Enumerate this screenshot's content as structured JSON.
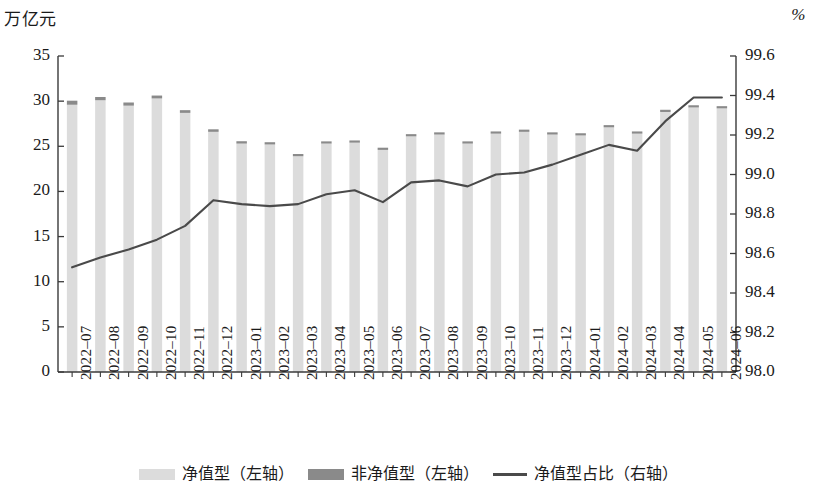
{
  "axes": {
    "left_unit": "万亿元",
    "right_unit": "%",
    "left_ticks": [
      "0",
      "5",
      "10",
      "15",
      "20",
      "25",
      "30",
      "35"
    ],
    "right_ticks": [
      "98.0",
      "98.2",
      "98.4",
      "98.6",
      "98.8",
      "99.0",
      "99.2",
      "99.4",
      "99.6"
    ]
  },
  "legend": {
    "items": [
      {
        "label": "净值型（左轴）",
        "type": "bar",
        "color": "#dcdcdc"
      },
      {
        "label": "非净值型（左轴）",
        "type": "bar",
        "color": "#8a8a8a"
      },
      {
        "label": "净值型占比（右轴）",
        "type": "line",
        "color": "#4a4a4a"
      }
    ]
  },
  "chart_data": {
    "type": "bar",
    "title": "",
    "subtitle": "",
    "xlabel": "",
    "ylabel": "万亿元",
    "y2label": "%",
    "ylim": [
      0,
      35
    ],
    "y2lim": [
      98.0,
      99.6
    ],
    "grid": false,
    "legend_position": "bottom",
    "stacked": true,
    "categories": [
      "2022-07",
      "2022-08",
      "2022-09",
      "2022-10",
      "2022-11",
      "2022-12",
      "2023-01",
      "2023-02",
      "2023-03",
      "2023-04",
      "2023-05",
      "2023-06",
      "2023-07",
      "2023-08",
      "2023-09",
      "2023-10",
      "2023-11",
      "2023-12",
      "2024-01",
      "2024-02",
      "2024-03",
      "2024-04",
      "2024-05",
      "2024-06"
    ],
    "series": [
      {
        "name": "净值型（左轴）",
        "axis": "left",
        "type": "bar",
        "color": "#dcdcdc",
        "values": [
          29.6,
          30.1,
          29.5,
          30.3,
          28.7,
          26.6,
          25.3,
          25.2,
          23.9,
          25.3,
          25.4,
          24.6,
          26.1,
          26.3,
          25.3,
          26.4,
          26.6,
          26.3,
          26.2,
          27.1,
          26.4,
          28.8,
          29.3,
          29.2
        ]
      },
      {
        "name": "非净值型（左轴）",
        "axis": "left",
        "type": "bar",
        "color": "#8a8a8a",
        "values": [
          0.45,
          0.36,
          0.35,
          0.32,
          0.3,
          0.28,
          0.26,
          0.25,
          0.24,
          0.24,
          0.23,
          0.23,
          0.22,
          0.22,
          0.21,
          0.21,
          0.2,
          0.2,
          0.19,
          0.18,
          0.18,
          0.18,
          0.18,
          0.18
        ]
      },
      {
        "name": "净值型占比（右轴）",
        "axis": "right",
        "type": "line",
        "color": "#4a4a4a",
        "values": [
          98.53,
          98.58,
          98.62,
          98.67,
          98.74,
          98.87,
          98.85,
          98.84,
          98.85,
          98.9,
          98.92,
          98.86,
          98.96,
          98.97,
          98.94,
          99.0,
          99.01,
          99.05,
          99.1,
          99.15,
          99.12,
          99.27,
          99.39,
          99.39
        ]
      }
    ]
  }
}
